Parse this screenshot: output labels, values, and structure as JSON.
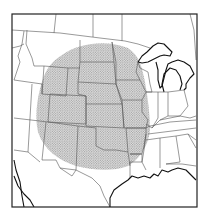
{
  "map": {
    "description": "Outline map of the central and eastern United States with a stippled (dotted gray) region over the Great Plains",
    "region": "Central United States",
    "shaded_area": {
      "label": "Stippled region",
      "pattern": "dots",
      "fill_color": "#bdbdbd",
      "dot_color": "#8a8a8a",
      "center": [
        92,
        106
      ],
      "radius_x": 56,
      "radius_y": 62
    },
    "frame_color": "#222222",
    "line_color": "#555555",
    "coast_color": "#111111",
    "background": "#ffffff"
  }
}
